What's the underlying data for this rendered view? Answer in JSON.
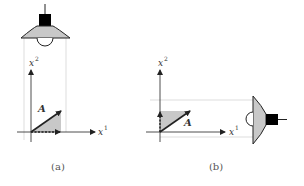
{
  "figure": {
    "panels": [
      {
        "id": "a",
        "caption": "(a)",
        "vector_label": "A",
        "x_axis_label": "x",
        "x_axis_sup": "1",
        "y_axis_label": "x",
        "y_axis_sup": "2",
        "lamp_position": "above",
        "projection": "onto x1 axis"
      },
      {
        "id": "b",
        "caption": "(b)",
        "vector_label": "A",
        "x_axis_label": "x",
        "x_axis_sup": "1",
        "y_axis_label": "x",
        "y_axis_sup": "2",
        "lamp_position": "right",
        "projection": "onto x2 axis"
      }
    ],
    "colors": {
      "shade": "#c8c8c8",
      "ink": "#222222",
      "lamp_box": "#000000",
      "guide": "#dddddd"
    }
  }
}
